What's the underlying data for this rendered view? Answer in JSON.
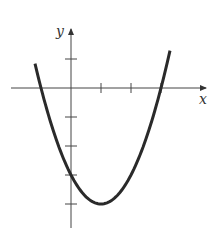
{
  "chart_data": {
    "type": "line",
    "title": "",
    "xlabel": "x",
    "ylabel": "y",
    "function": "y = x^2 - 2x - 3",
    "x_ticks": [
      1,
      2,
      3
    ],
    "y_ticks": [
      1,
      -1,
      -2,
      -3,
      -4
    ],
    "xlim": [
      -1.2,
      3.3
    ],
    "ylim": [
      -4.7,
      2.0
    ],
    "grid": false,
    "series": [
      {
        "name": "parabola",
        "x": [
          -1.1,
          -1,
          0,
          1,
          2,
          3,
          3.3
        ],
        "values": [
          0.41,
          0,
          -3,
          -4,
          -3,
          0,
          1.29
        ]
      }
    ],
    "annotations": {
      "roots": [
        -1,
        3
      ],
      "y_intercept": -3,
      "vertex": [
        1,
        -4
      ]
    }
  },
  "labels": {
    "x_axis": "x",
    "y_axis": "y"
  }
}
